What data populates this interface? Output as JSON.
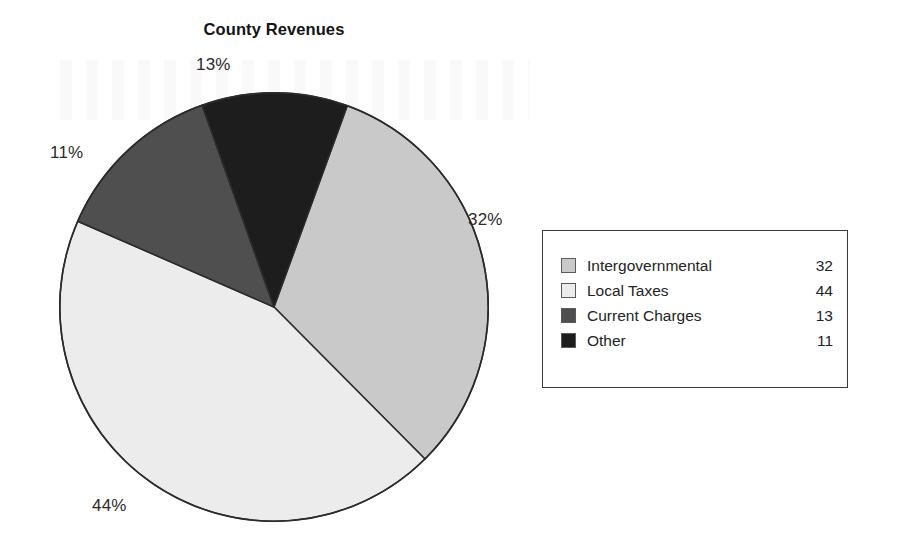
{
  "chart_data": {
    "type": "pie",
    "title": "County Revenues",
    "categories": [
      "Intergovernmental",
      "Local Taxes",
      "Current Charges",
      "Other"
    ],
    "values": [
      32,
      44,
      13,
      11
    ],
    "percent_labels": [
      "32%",
      "44%",
      "13%",
      "11%"
    ],
    "colors": [
      "#c9c9c9",
      "#ececec",
      "#4f4f4f",
      "#1d1d1d"
    ],
    "slice_edge_color": "#2b2b2b",
    "start_angle_deg": 20,
    "direction": "clockwise",
    "legend_position": "right",
    "legend_border": true,
    "grid": false,
    "xlabel": "",
    "ylabel": ""
  },
  "title": {
    "text": "County Revenues"
  },
  "callouts": {
    "intergovernmental": "32%",
    "local_taxes": "44%",
    "current_charges": "13%",
    "other": "11%"
  },
  "legend": {
    "rows": [
      {
        "label": "Intergovernmental",
        "value": "32",
        "color": "#c9c9c9"
      },
      {
        "label": "Local Taxes",
        "value": "44",
        "color": "#ececec"
      },
      {
        "label": "Current Charges",
        "value": "13",
        "color": "#4f4f4f"
      },
      {
        "label": "Other",
        "value": "11",
        "color": "#1d1d1d"
      }
    ]
  }
}
